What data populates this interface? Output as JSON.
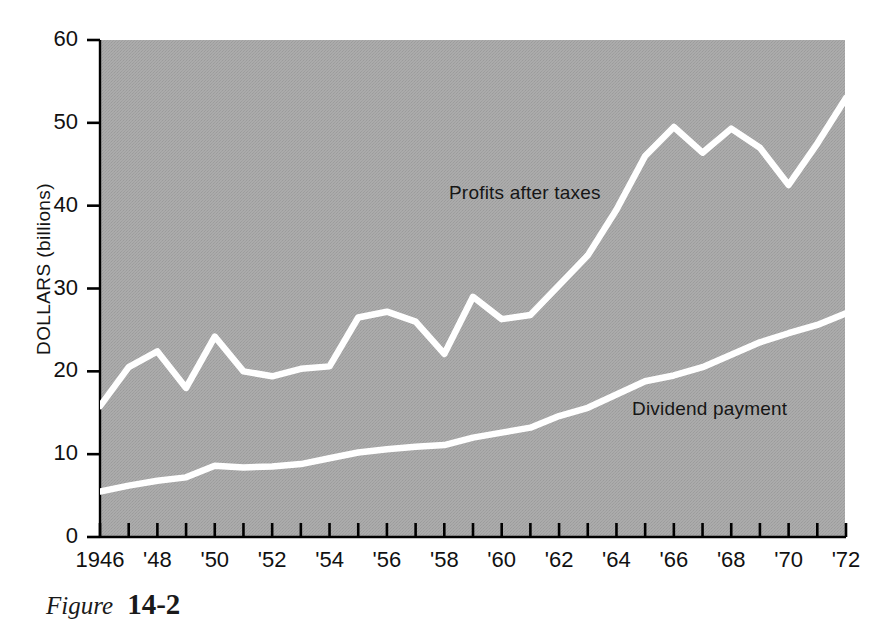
{
  "figure": {
    "caption_word": "Figure",
    "caption_number": "14-2"
  },
  "chart_data": {
    "type": "line",
    "title": "",
    "subtitle": "",
    "xlabel": "",
    "ylabel": "DOLLARS (billions)",
    "xlim": [
      1946,
      1972
    ],
    "ylim": [
      0,
      60
    ],
    "grid": false,
    "legend_position": "inline-annotations",
    "background_color": "#a8a8a8",
    "line_color": "#ffffff",
    "axis_color": "#000000",
    "y_ticks": [
      0,
      10,
      20,
      30,
      40,
      50,
      60
    ],
    "y_tick_labels": [
      "0",
      "10",
      "20",
      "30",
      "40",
      "50",
      "60"
    ],
    "x_ticks": [
      1946,
      1947,
      1948,
      1949,
      1950,
      1951,
      1952,
      1953,
      1954,
      1955,
      1956,
      1957,
      1958,
      1959,
      1960,
      1961,
      1962,
      1963,
      1964,
      1965,
      1966,
      1967,
      1968,
      1969,
      1970,
      1971,
      1972
    ],
    "x_tick_labels": [
      "1946",
      "'48",
      "'50",
      "'52",
      "'54",
      "'56",
      "'58",
      "'60",
      "'62",
      "'64",
      "'66",
      "'68",
      "'70",
      "'72"
    ],
    "x_labeled_years": [
      1946,
      1948,
      1950,
      1952,
      1954,
      1956,
      1958,
      1960,
      1962,
      1964,
      1966,
      1968,
      1970,
      1972
    ],
    "x": [
      1946,
      1947,
      1948,
      1949,
      1950,
      1951,
      1952,
      1953,
      1954,
      1955,
      1956,
      1957,
      1958,
      1959,
      1960,
      1961,
      1962,
      1963,
      1964,
      1965,
      1966,
      1967,
      1968,
      1969,
      1970,
      1971,
      1972
    ],
    "series": [
      {
        "name": "Profits after taxes",
        "annotation_label": "Profits after taxes",
        "color": "#ffffff",
        "values": [
          15.8,
          20.5,
          22.4,
          18.0,
          24.2,
          20.0,
          19.4,
          20.3,
          20.6,
          26.5,
          27.2,
          26.0,
          22.1,
          29.0,
          26.3,
          26.8,
          30.4,
          34.0,
          39.5,
          46.0,
          49.5,
          46.4,
          49.3,
          47.0,
          42.5,
          47.5,
          53.0
        ]
      },
      {
        "name": "Dividend payment",
        "annotation_label": "Dividend payment",
        "color": "#ffffff",
        "values": [
          5.5,
          6.2,
          6.8,
          7.2,
          8.6,
          8.4,
          8.5,
          8.8,
          9.5,
          10.2,
          10.6,
          10.9,
          11.1,
          12.0,
          12.6,
          13.2,
          14.6,
          15.6,
          17.2,
          18.8,
          19.5,
          20.5,
          22.0,
          23.5,
          24.6,
          25.6,
          27.0
        ]
      }
    ]
  }
}
